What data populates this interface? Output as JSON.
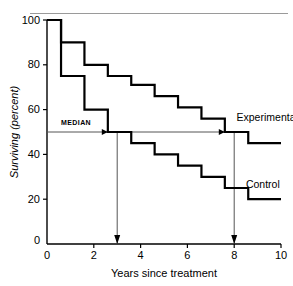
{
  "figure": {
    "top_rule": true,
    "background": "#ffffff",
    "ink": "#000000"
  },
  "chart_data": {
    "type": "line",
    "subtype": "step-post kaplan-meier survival curves",
    "title": "",
    "xlabel": "Years since treatment",
    "ylabel": "Surviving (percent)",
    "xlim": [
      0,
      10
    ],
    "ylim": [
      0,
      100
    ],
    "xticks": [
      0,
      2,
      4,
      6,
      8,
      10
    ],
    "xtick_labels": [
      "0",
      "2",
      "4",
      "6",
      "8",
      "10"
    ],
    "yticks": [
      0,
      20,
      40,
      60,
      80,
      100
    ],
    "ytick_labels": [
      "0",
      "20",
      "40",
      "60",
      "80",
      "100"
    ],
    "grid": false,
    "legend": "inline labels at right end of each curve",
    "series": [
      {
        "name": "Experimental",
        "label": "Experimental",
        "label_x": 8.1,
        "label_y": 55,
        "step": "post",
        "x": [
          0.0,
          0.6,
          1.6,
          2.6,
          3.6,
          4.6,
          5.6,
          6.6,
          7.6,
          8.6,
          10.0
        ],
        "y": [
          100,
          90,
          80,
          75,
          71,
          66,
          61,
          56,
          50,
          45,
          45
        ]
      },
      {
        "name": "Control",
        "label": "Control",
        "label_x": 8.5,
        "label_y": 25,
        "step": "post",
        "x": [
          0.0,
          0.6,
          1.6,
          2.6,
          3.6,
          4.6,
          5.6,
          6.6,
          7.6,
          8.6,
          10.0
        ],
        "y": [
          100,
          75,
          60,
          50,
          45,
          40,
          35,
          30,
          25,
          20,
          20
        ]
      }
    ],
    "annotations": [
      {
        "name": "median-line",
        "label": "MEDIAN",
        "type": "horizontal-reference-with-arrowheads",
        "y": 50,
        "x_start": 0,
        "x_end": 7.6,
        "arrowhead_x": [
          2.6,
          7.6
        ],
        "label_x": 0.6,
        "label_y": 53
      },
      {
        "name": "experimental-median-dropline",
        "type": "vertical-arrow-down",
        "x": 3.0,
        "y_start": 50,
        "y_end": 0,
        "axis_label": "3"
      },
      {
        "name": "control-median-dropline",
        "type": "vertical-arrow-down",
        "x": 8.0,
        "y_start": 50,
        "y_end": 0,
        "axis_label": "8"
      }
    ]
  }
}
